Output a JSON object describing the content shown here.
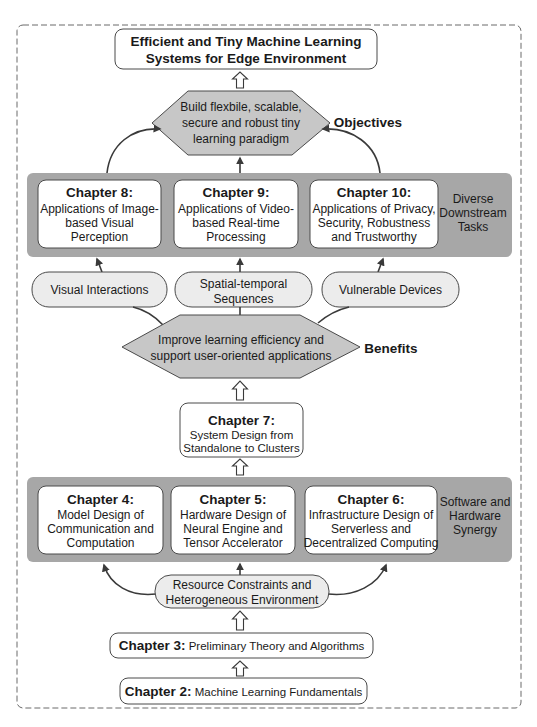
{
  "title": {
    "lines": [
      "Efficient and Tiny Machine Learning",
      "Systems for Edge Environment"
    ]
  },
  "objectives": {
    "hexagon_lines": [
      "Build flexbile, scalable,",
      "secure and robust tiny",
      "learning paradigm"
    ],
    "label": "Objectives"
  },
  "downstream": {
    "label_lines": [
      "Diverse",
      "Downstream",
      "Tasks"
    ],
    "chapters": [
      {
        "title": "Chapter 8:",
        "lines": [
          "Applications of Image-",
          "based Visual",
          "Perception"
        ]
      },
      {
        "title": "Chapter 9:",
        "lines": [
          "Applications of Video-",
          "based Real-time",
          "Processing"
        ]
      },
      {
        "title": "Chapter 10:",
        "lines": [
          "Applications of Privacy,",
          "Security, Robustness",
          "and Trustworthy"
        ]
      }
    ]
  },
  "bridges": [
    {
      "lines": [
        "Visual Interactions"
      ]
    },
    {
      "lines": [
        "Spatial-temporal",
        "Sequences"
      ]
    },
    {
      "lines": [
        "Vulnerable Devices"
      ]
    }
  ],
  "benefits": {
    "hexagon_lines": [
      "Improve learning efficiency and",
      "support user-oriented applications"
    ],
    "label": "Benefits"
  },
  "chapter7": {
    "title": "Chapter 7:",
    "lines": [
      "System Design from",
      "Standalone to Clusters"
    ]
  },
  "synergy": {
    "label_lines": [
      "Software and",
      "Hardware",
      "Synergy"
    ],
    "chapters": [
      {
        "title": "Chapter 4:",
        "lines": [
          "Model Design of",
          "Communication and",
          "Computation"
        ]
      },
      {
        "title": "Chapter 5:",
        "lines": [
          "Hardware Design of",
          "Neural Engine and",
          "Tensor Accelerator"
        ]
      },
      {
        "title": "Chapter 6:",
        "lines": [
          "Infrastructure Design of",
          "Serverless and",
          "Decentralized Computing"
        ]
      }
    ]
  },
  "constraints": {
    "lines": [
      "Resource Constraints and",
      "Heterogeneous Environment"
    ]
  },
  "chapter3": {
    "title": "Chapter 3:",
    "text": " Preliminary Theory and Algorithms"
  },
  "chapter2": {
    "title": "Chapter 2:",
    "text": " Machine Learning Fundamentals"
  },
  "colors": {
    "band": "#a7a7a7",
    "hexagon": "#c7c7c7",
    "pill": "#ececec",
    "box": "#ffffff",
    "stroke": "#4a4a4a"
  }
}
